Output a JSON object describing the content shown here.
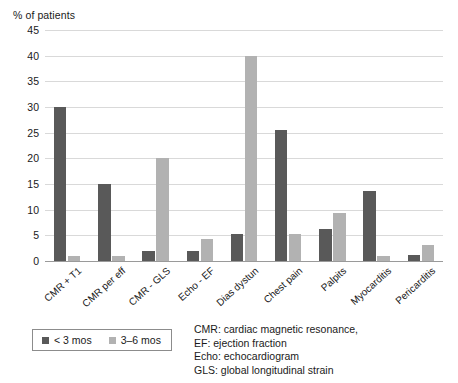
{
  "chart_data": {
    "type": "bar",
    "title": "",
    "ylabel": "% of patients",
    "xlabel": "",
    "ylim": [
      0,
      45
    ],
    "yticks": [
      0,
      5,
      10,
      15,
      20,
      25,
      30,
      35,
      40,
      45
    ],
    "grid": true,
    "legend_position": "bottom-left",
    "categories": [
      "CMR + T1",
      "CMR per eff",
      "CMR - GLS",
      "Echo - EF",
      "Dias dystun",
      "Chest pain",
      "Palpits",
      "Myocarditis",
      "Pericarditis"
    ],
    "series": [
      {
        "name": "< 3 mos",
        "color": "#595959",
        "values": [
          30,
          15,
          2,
          2,
          5.2,
          25.5,
          6.3,
          13.6,
          1.2
        ]
      },
      {
        "name": "3–6 mos",
        "color": "#b2b2b2",
        "values": [
          1,
          1,
          20,
          4.3,
          40,
          5.2,
          9.3,
          1,
          3.1
        ]
      }
    ]
  },
  "legend": {
    "items": [
      {
        "label": "< 3 mos",
        "color": "#595959"
      },
      {
        "label": "3–6 mos",
        "color": "#b2b2b2"
      }
    ]
  },
  "footnote": {
    "lines": [
      "CMR: cardiac magnetic resonance,",
      "EF: ejection fraction",
      "Echo: echocardiogram",
      "GLS: global longitudinal strain"
    ]
  }
}
